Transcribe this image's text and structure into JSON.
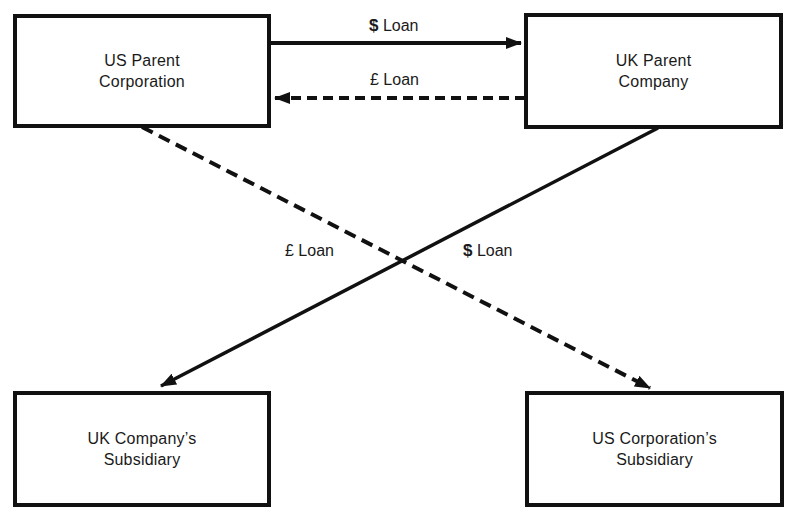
{
  "diagram": {
    "type": "back-to-back / parallel loan structure",
    "nodes": {
      "us_parent": {
        "label": "US Parent\nCorporation"
      },
      "uk_parent": {
        "label": "UK Parent\nCompany"
      },
      "uk_subsidiary": {
        "label": "UK Company’s\nSubsidiary"
      },
      "us_subsidiary": {
        "label": "US Corporation’s\nSubsidiary"
      }
    },
    "edges": [
      {
        "id": "top_dollar",
        "from": "us_parent",
        "to": "uk_parent",
        "style": "solid",
        "currency_symbol": "$",
        "text": "Loan"
      },
      {
        "id": "top_pound",
        "from": "uk_parent",
        "to": "us_parent",
        "style": "dashed",
        "currency_symbol": "£",
        "text": "Loan"
      },
      {
        "id": "cross_pound",
        "from": "us_parent",
        "to": "us_subsidiary",
        "style": "dashed",
        "currency_symbol": "£",
        "text": "Loan"
      },
      {
        "id": "cross_dollar",
        "from": "uk_parent",
        "to": "uk_subsidiary",
        "style": "solid",
        "currency_symbol": "$",
        "text": "Loan"
      }
    ],
    "colors": {
      "line": "#111111",
      "background": "#ffffff",
      "text": "#1a1a1a"
    }
  }
}
